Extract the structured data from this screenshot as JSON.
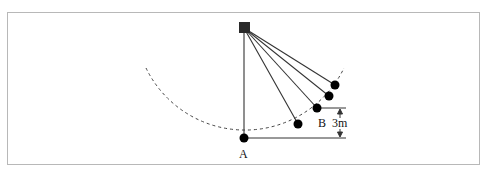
{
  "diagram": {
    "type": "pendulum",
    "labels": {
      "point_a": "A",
      "point_b": "B",
      "height": "3m"
    },
    "colors": {
      "stroke": "#333333",
      "ball": "#000000",
      "pivot": "#2a2a2a",
      "frame": "#b8b8b8"
    },
    "pivot": {
      "x": 244,
      "y": 28
    },
    "length_px": 110,
    "balls": [
      {
        "name": "A",
        "x": 244,
        "y": 138
      },
      {
        "x": 298,
        "y": 124
      },
      {
        "name": "B",
        "x": 317,
        "y": 108
      },
      {
        "x": 329,
        "y": 96
      },
      {
        "x": 335,
        "y": 85
      }
    ]
  }
}
